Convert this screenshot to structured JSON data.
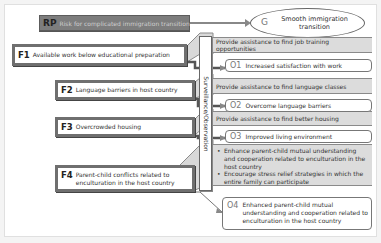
{
  "diagram": {
    "risk": {
      "code": "RP",
      "label": "Risk for complicated immigration transition"
    },
    "goal": {
      "code": "G",
      "label_line1": "Smooth immigration",
      "label_line2": "transition"
    },
    "surveillance": {
      "label": "Surveillance/Observation"
    },
    "factors": [
      {
        "code": "F1",
        "label": "Available work below educational preparation"
      },
      {
        "code": "F2",
        "label": "Language barriers in host country"
      },
      {
        "code": "F3",
        "label": "Overcrowded housing"
      },
      {
        "code": "F4",
        "label_line1": "Parent-child conflicts related to",
        "label_line2": "enculturation in the host country"
      }
    ],
    "interventions": [
      {
        "label": "Provide assistance to find job training opportunities"
      },
      {
        "label": "Provide assistance to find language classes"
      },
      {
        "label": "Provide assistance to find better housing"
      },
      {
        "bullets": [
          "Enhance parent-child mutual understanding and cooperation related to enculturation in the host country",
          "Encourage stress relief strategies in which the entire family can participate"
        ]
      }
    ],
    "outcomes": [
      {
        "code": "O1",
        "label": "Increased satisfaction with work"
      },
      {
        "code": "O2",
        "label": "Overcome language barriers"
      },
      {
        "code": "O3",
        "label": "Improved living environment"
      },
      {
        "code": "O4",
        "label": "Enhanced parent-child mutual understanding and cooperation related to enculturation in the host country"
      }
    ]
  }
}
